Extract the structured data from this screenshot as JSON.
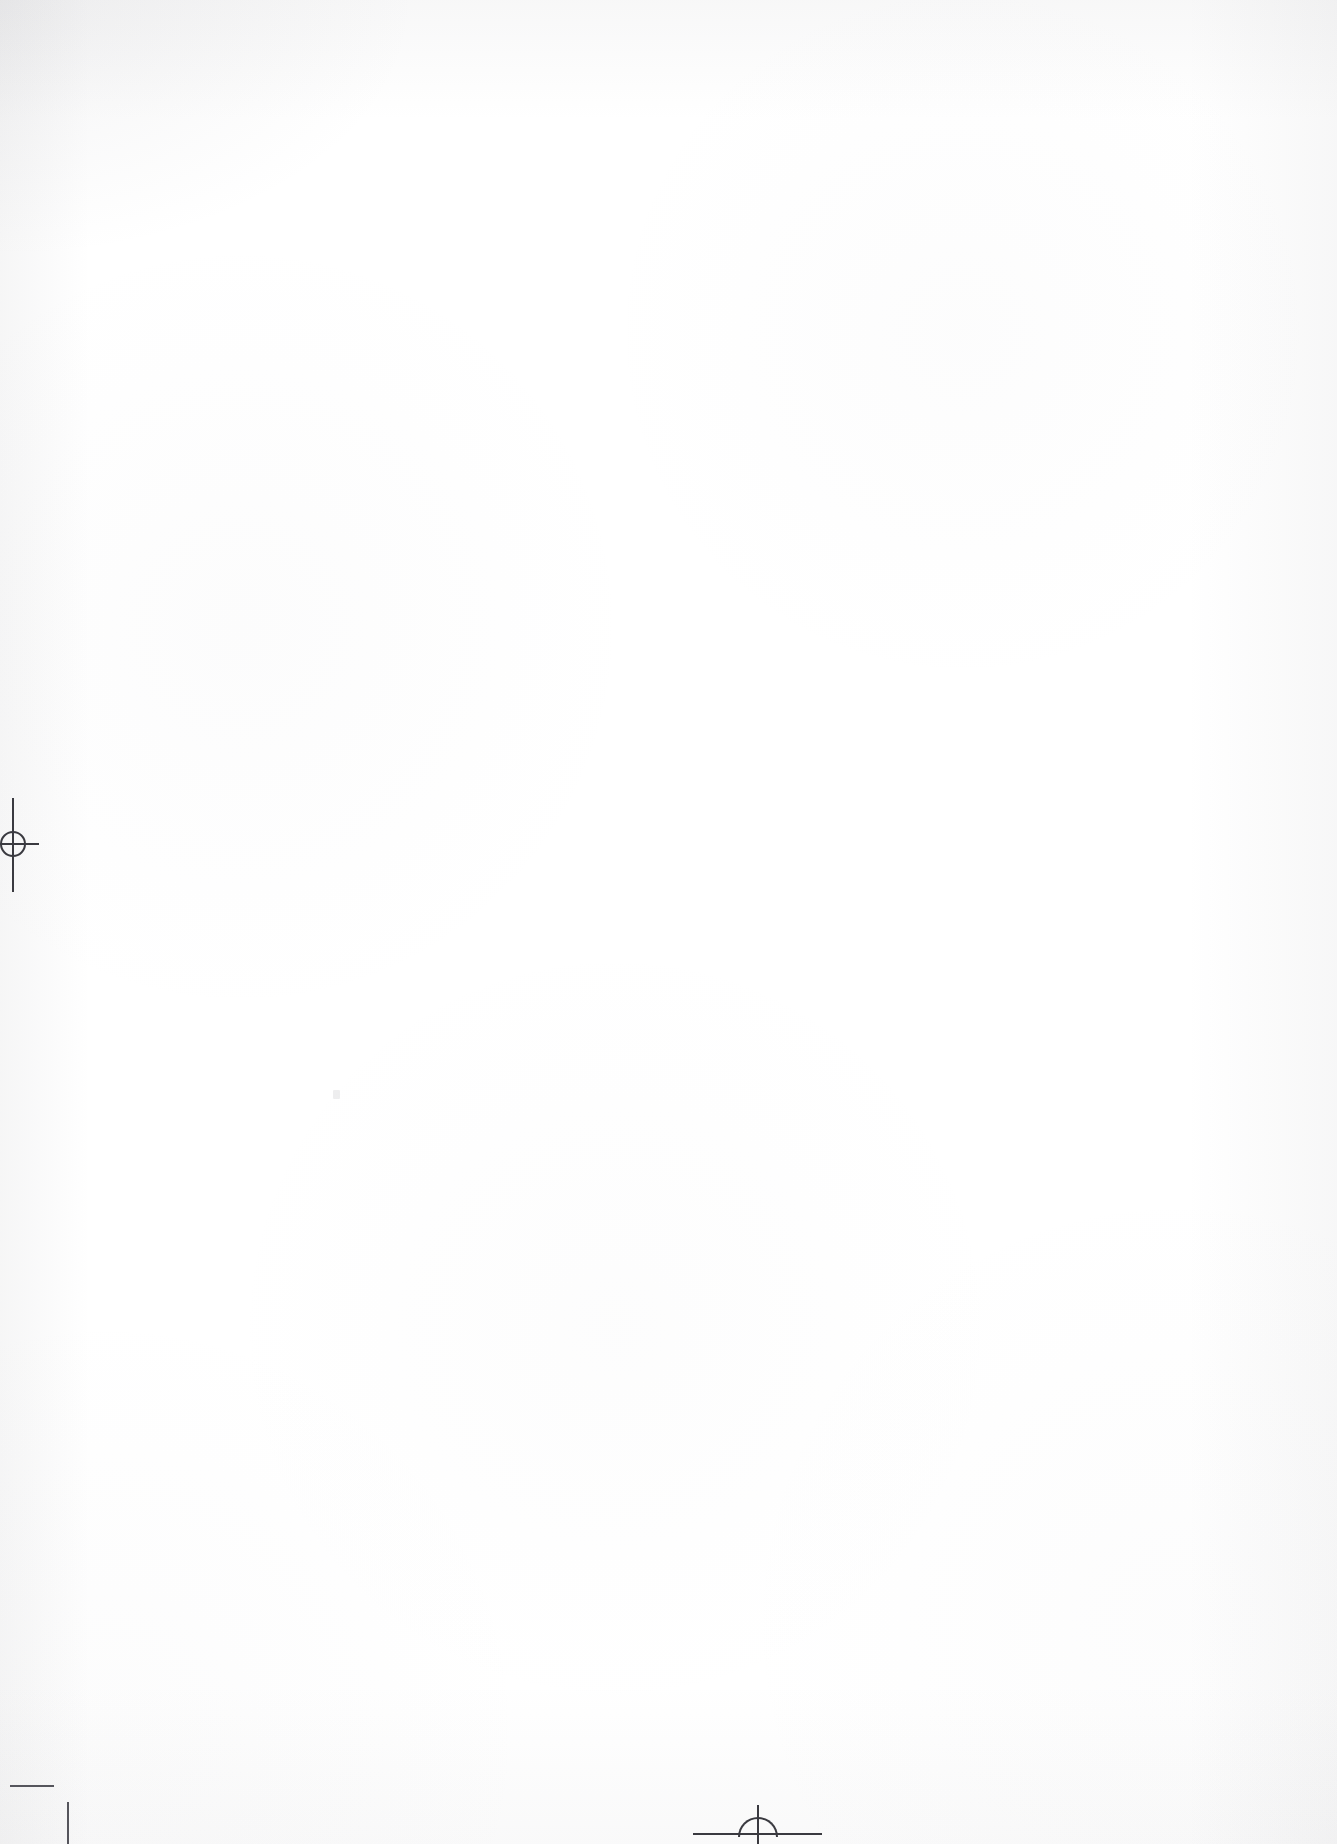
{
  "document": {
    "title": "Scanned blank page",
    "page_kind": "blank leaf",
    "background_color": "#ffffff",
    "ink_color": "#3a3a40",
    "width_px": 1337,
    "height_px": 1844,
    "visible_text": ""
  },
  "marks": {
    "registration_left": {
      "name": "registration mark",
      "kind": "crosshair-with-circle",
      "edge": "left",
      "x_px": 13,
      "y_px": 843,
      "circle_diameter_px": 26,
      "vertical_rule_length_px": 94,
      "horizontal_rule_length_px": 39,
      "color": "#3a3a40"
    },
    "registration_bottom": {
      "name": "registration mark",
      "kind": "semicircle-on-rule",
      "edge": "bottom",
      "x_px": 758,
      "y_px": 1834,
      "semicircle_diameter_px": 40,
      "horizontal_rule_length_px": 129,
      "vertical_tick_length_px": 39,
      "color": "#3a3a40"
    },
    "crop_bottom_left": {
      "name": "crop mark",
      "kind": "offset-corner-pair",
      "corner": "bottom-left",
      "horizontal_segment_length_px": 44,
      "vertical_segment_length_px": 42,
      "color": "#55555c"
    }
  },
  "scan": {
    "edge_shading": "present",
    "paper_grain": "faint",
    "speck_count": 1
  }
}
